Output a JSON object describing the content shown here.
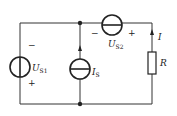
{
  "diagram": {
    "type": "circuit",
    "components": {
      "us1": {
        "label": "U",
        "sub": "S1",
        "minus": "−",
        "plus": "+"
      },
      "is": {
        "label": "I",
        "sub": "S"
      },
      "us2": {
        "label": "U",
        "sub": "S2",
        "minus": "−",
        "plus": "+"
      },
      "r": {
        "label": "R"
      },
      "i": {
        "label": "I"
      }
    },
    "colors": {
      "wire": "#333333",
      "background": "#ffffff"
    }
  }
}
